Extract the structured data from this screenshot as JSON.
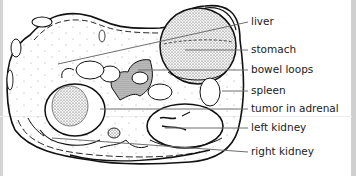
{
  "figure": {
    "labels": [
      {
        "id": "liver",
        "text": "liver"
      },
      {
        "id": "stomach",
        "text": "stomach"
      },
      {
        "id": "bowel-loops",
        "text": "bowel loops"
      },
      {
        "id": "spleen",
        "text": "spleen"
      },
      {
        "id": "tumor-in-adrenal",
        "text": "tumor in adrenal"
      },
      {
        "id": "left-kidney",
        "text": "left kidney"
      },
      {
        "id": "right-kidney",
        "text": "right kidney"
      }
    ],
    "colors": {
      "ink": "#111111",
      "leader": "#6e6e6e",
      "stipple": "#555555",
      "border": "#d0d0d0"
    }
  }
}
